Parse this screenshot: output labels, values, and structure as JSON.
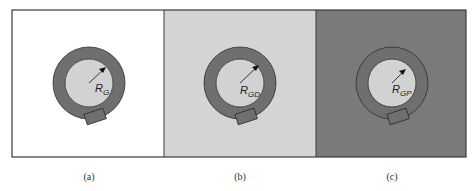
{
  "figure": {
    "frame": {
      "x": 12,
      "y": 10,
      "width": 454,
      "height": 147,
      "stroke": "#3a3a3a"
    },
    "ring_color": "#6f6f6f",
    "ring_outline": "#2e2e2e",
    "core_color": "#d2d2d2",
    "panels": [
      {
        "id": "a",
        "caption": "(a)",
        "background": "#ffffff",
        "x": 12,
        "width": 152,
        "center": [
          89,
          83
        ],
        "radius_symbol": "R",
        "radius_subscript": "G"
      },
      {
        "id": "b",
        "caption": "(b)",
        "background": "#d4d4d4",
        "x": 164,
        "width": 152,
        "center": [
          240,
          83
        ],
        "radius_symbol": "R",
        "radius_subscript": "GD"
      },
      {
        "id": "c",
        "caption": "(c)",
        "background": "#7a7a7a",
        "x": 316,
        "width": 150,
        "center": [
          392,
          83
        ],
        "radius_symbol": "R",
        "radius_subscript": "GP"
      }
    ]
  }
}
